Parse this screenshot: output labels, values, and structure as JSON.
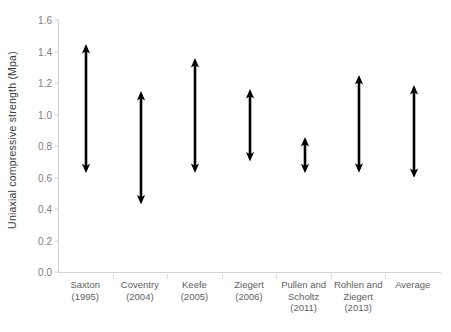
{
  "chart_data": {
    "type": "bar",
    "subtype": "range-double-arrow",
    "title": "",
    "xlabel": "",
    "ylabel": "Uniaxial compressive strength (Mpa)",
    "ylim": [
      0.0,
      1.6
    ],
    "ytick_step": 0.2,
    "ytick_labels": [
      "1.6",
      "1.4",
      "1.2",
      "1.0",
      "0.8",
      "0.6",
      "0.4",
      "0.2",
      "0.0"
    ],
    "ytick_values": [
      1.6,
      1.4,
      1.2,
      1.0,
      0.8,
      0.6,
      0.4,
      0.2,
      0.0
    ],
    "grid": false,
    "legend": "none",
    "series_color": "#000000",
    "axis_color": "#d2d2d2",
    "categories": [
      "Saxton (1995)",
      "Coventry (2004)",
      "Keefe (2005)",
      "Ziegert (2006)",
      "Pullen and Scholtz (2011)",
      "Rohlen and Ziegert (2013)",
      "Average"
    ],
    "category_lines": [
      [
        "Saxton",
        "(1995)"
      ],
      [
        "Coventry",
        "(2004)"
      ],
      [
        "Keefe (2005)"
      ],
      [
        "Ziegert",
        "(2006)"
      ],
      [
        "Pullen and",
        "Scholtz",
        "(2011)"
      ],
      [
        "Rohlen and",
        "Ziegert",
        "(2013)"
      ],
      [
        "Average"
      ]
    ],
    "ranges": [
      {
        "category": "Saxton (1995)",
        "low": 0.63,
        "high": 1.45
      },
      {
        "category": "Coventry (2004)",
        "low": 0.43,
        "high": 1.15
      },
      {
        "category": "Keefe (2005)",
        "low": 0.63,
        "high": 1.36
      },
      {
        "category": "Ziegert (2006)",
        "low": 0.7,
        "high": 1.16
      },
      {
        "category": "Pullen and Scholtz (2011)",
        "low": 0.63,
        "high": 0.86
      },
      {
        "category": "Rohlen and Ziegert (2013)",
        "low": 0.63,
        "high": 1.25
      },
      {
        "category": "Average",
        "low": 0.6,
        "high": 1.19
      }
    ]
  }
}
